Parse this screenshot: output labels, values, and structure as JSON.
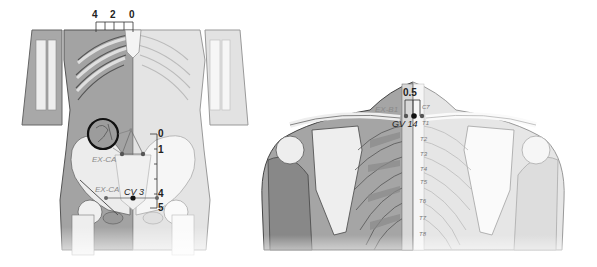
{
  "figures": {
    "anterior": {
      "view": "anterior torso and pelvis",
      "horizontal_scale": {
        "ticks": [
          "4",
          "2",
          "0"
        ]
      },
      "vertical_scale": {
        "ticks": [
          "0",
          "1",
          "4",
          "5"
        ]
      },
      "points": {
        "ex_ca": "EX-CA",
        "ex_ca_lower": "EX-CA",
        "cv3": "CV 3"
      },
      "highlight": "circle-inset"
    },
    "posterior": {
      "view": "posterior upper back and shoulders",
      "scale": {
        "value": "0.5"
      },
      "points": {
        "ex_b1": "EX-B1",
        "gv14": "GV 14"
      },
      "vertebrae": [
        "C7",
        "T1",
        "T2",
        "T3",
        "T4",
        "T5",
        "T6",
        "T7",
        "T8"
      ]
    }
  },
  "colors": {
    "skin_dark": "#9e9e9e",
    "skin_light": "#e4e4e4",
    "bone": "#f4f4f4",
    "outline": "#555555",
    "point": "#111111"
  }
}
